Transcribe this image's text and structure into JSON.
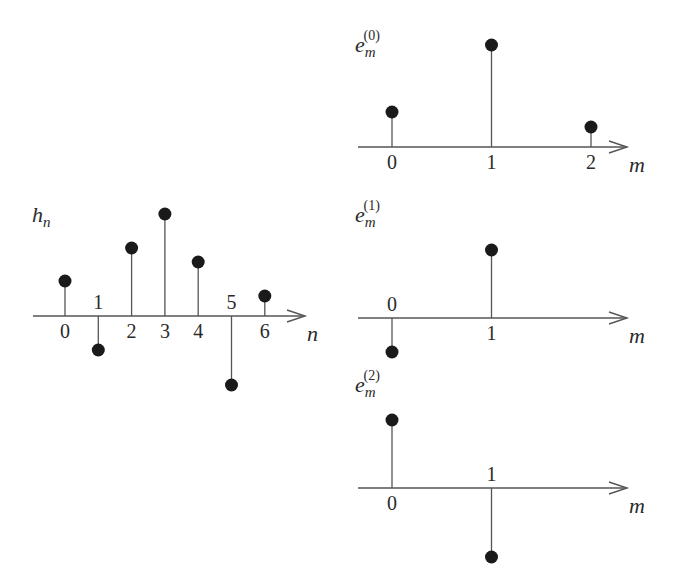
{
  "colors": {
    "stroke": "#555555",
    "marker": "#1a1a1a",
    "text": "#2a2a2a",
    "background": "#ffffff"
  },
  "chart_data": [
    {
      "type": "stem",
      "id": "h",
      "title": "h_n",
      "ylabel_main": "h",
      "ylabel_sub": "n",
      "xlabel": "n",
      "categories": [
        "0",
        "1",
        "2",
        "3",
        "4",
        "5",
        "6"
      ],
      "values": [
        35,
        -34,
        68,
        102,
        54,
        -69,
        20
      ],
      "origin": {
        "x": 65,
        "y": 316
      },
      "spacing": 33.3,
      "axis": {
        "x1": 33,
        "x2": 305
      },
      "label_above_for_negative": true
    },
    {
      "type": "stem",
      "id": "e0",
      "title": "e_m^(0)",
      "ylabel_main": "e",
      "ylabel_sub": "m",
      "ylabel_sup": "(0)",
      "xlabel": "m",
      "categories": [
        "0",
        "1",
        "2"
      ],
      "values": [
        35,
        102,
        20
      ],
      "origin": {
        "x": 392,
        "y": 147
      },
      "spacing": 99.5,
      "axis": {
        "x1": 358,
        "x2": 627
      }
    },
    {
      "type": "stem",
      "id": "e1",
      "title": "e_m^(1)",
      "ylabel_main": "e",
      "ylabel_sub": "m",
      "ylabel_sup": "(1)",
      "xlabel": "m",
      "categories": [
        "0",
        "1"
      ],
      "values": [
        -34,
        68
      ],
      "origin": {
        "x": 392,
        "y": 318
      },
      "spacing": 99.5,
      "axis": {
        "x1": 358,
        "x2": 627
      }
    },
    {
      "type": "stem",
      "id": "e2",
      "title": "e_m^(2)",
      "ylabel_main": "e",
      "ylabel_sub": "m",
      "ylabel_sup": "(2)",
      "xlabel": "m",
      "categories": [
        "0",
        "1"
      ],
      "values": [
        68,
        -69
      ],
      "origin": {
        "x": 392,
        "y": 488
      },
      "spacing": 99.5,
      "axis": {
        "x1": 358,
        "x2": 627
      }
    }
  ],
  "labels": {
    "h": {
      "main": "h",
      "sub": "n",
      "x": 32,
      "y": 222
    },
    "e0": {
      "main": "e",
      "sub": "m",
      "sup": "(0)",
      "x": 355,
      "y": 52
    },
    "e1": {
      "main": "e",
      "sub": "m",
      "sup": "(1)",
      "x": 355,
      "y": 222
    },
    "e2": {
      "main": "e",
      "sub": "m",
      "sup": "(2)",
      "x": 355,
      "y": 392
    }
  }
}
